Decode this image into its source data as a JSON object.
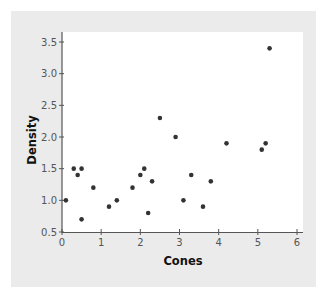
{
  "chart_data": {
    "type": "scatter",
    "title": "",
    "xlabel": "Cones",
    "ylabel": "Density",
    "xlim": [
      0,
      6
    ],
    "ylim": [
      0.5,
      3.5
    ],
    "xticks": [
      0,
      1,
      2,
      3,
      4,
      5,
      6
    ],
    "yticks": [
      0.5,
      1.0,
      1.5,
      2.0,
      2.5,
      3.0,
      3.5
    ],
    "xtick_labels": [
      "0",
      "1",
      "2",
      "3",
      "4",
      "5",
      "6"
    ],
    "ytick_labels": [
      "0.5",
      "1.0",
      "1.5",
      "2.0",
      "2.5",
      "3.0",
      "3.5"
    ],
    "grid": false,
    "legend": null,
    "points": [
      {
        "x": 0.1,
        "y": 1.0
      },
      {
        "x": 0.3,
        "y": 1.5
      },
      {
        "x": 0.4,
        "y": 1.4
      },
      {
        "x": 0.5,
        "y": 1.5
      },
      {
        "x": 0.5,
        "y": 0.7
      },
      {
        "x": 0.8,
        "y": 1.2
      },
      {
        "x": 1.2,
        "y": 0.9
      },
      {
        "x": 1.4,
        "y": 1.0
      },
      {
        "x": 1.8,
        "y": 1.2
      },
      {
        "x": 2.0,
        "y": 1.4
      },
      {
        "x": 2.1,
        "y": 1.5
      },
      {
        "x": 2.2,
        "y": 0.8
      },
      {
        "x": 2.3,
        "y": 1.3
      },
      {
        "x": 2.5,
        "y": 2.3
      },
      {
        "x": 2.9,
        "y": 2.0
      },
      {
        "x": 3.1,
        "y": 1.0
      },
      {
        "x": 3.3,
        "y": 1.4
      },
      {
        "x": 3.6,
        "y": 0.9
      },
      {
        "x": 3.8,
        "y": 1.3
      },
      {
        "x": 4.2,
        "y": 1.9
      },
      {
        "x": 5.1,
        "y": 1.8
      },
      {
        "x": 5.2,
        "y": 1.9
      },
      {
        "x": 5.3,
        "y": 3.4
      }
    ],
    "colors": {
      "panel_background": "#ebebeb",
      "plot_background": "#ffffff",
      "point": "#333333",
      "axis": "#555555"
    }
  }
}
